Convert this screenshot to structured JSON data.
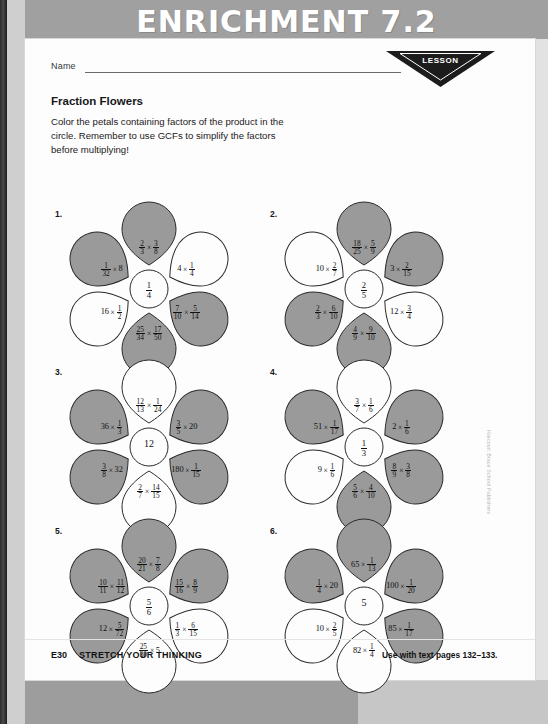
{
  "header": {
    "title": "ENRICHMENT 7.2"
  },
  "lesson_badge": {
    "word": "LESSON",
    "number": "7.2"
  },
  "name_field": {
    "label": "Name",
    "value": ""
  },
  "worksheet": {
    "title": "Fraction Flowers",
    "instruction_lines": [
      "Color the petals containing factors of the product in the",
      "circle. Remember to use GCFs to simplify the factors",
      "before multiplying!"
    ]
  },
  "colors": {
    "header_band": "#a0a0a0",
    "petal_shaded": "#9a9a9a",
    "petal_white": "#fdfdfd",
    "petal_outline": "#2a2a2a",
    "page": "#fdfdfd",
    "scan_background": "#8f8f8f"
  },
  "flowers": [
    {
      "number": "1.",
      "center": {
        "whole": "",
        "num": "1",
        "den": "4"
      },
      "petals": [
        {
          "position": "top",
          "shaded": true,
          "left": {
            "num": "2",
            "den": "3"
          },
          "right": {
            "num": "3",
            "den": "8"
          }
        },
        {
          "position": "upper-right",
          "shaded": false,
          "left": {
            "whole": "4"
          },
          "right": {
            "num": "1",
            "den": "4"
          }
        },
        {
          "position": "lower-right",
          "shaded": true,
          "left": {
            "num": "7",
            "den": "10"
          },
          "right": {
            "num": "5",
            "den": "14"
          }
        },
        {
          "position": "bottom",
          "shaded": true,
          "left": {
            "num": "25",
            "den": "34"
          },
          "right": {
            "num": "17",
            "den": "50"
          }
        },
        {
          "position": "lower-left",
          "shaded": false,
          "left": {
            "whole": "16"
          },
          "right": {
            "num": "1",
            "den": "2"
          }
        },
        {
          "position": "upper-left",
          "shaded": true,
          "left": {
            "num": "1",
            "den": "32"
          },
          "right": {
            "whole": "8"
          }
        }
      ]
    },
    {
      "number": "2.",
      "center": {
        "whole": "",
        "num": "2",
        "den": "5"
      },
      "petals": [
        {
          "position": "top",
          "shaded": true,
          "left": {
            "num": "18",
            "den": "25"
          },
          "right": {
            "num": "5",
            "den": "9"
          }
        },
        {
          "position": "upper-right",
          "shaded": true,
          "left": {
            "whole": "3"
          },
          "right": {
            "num": "2",
            "den": "15"
          }
        },
        {
          "position": "lower-right",
          "shaded": false,
          "left": {
            "whole": "12"
          },
          "right": {
            "num": "3",
            "den": "4"
          }
        },
        {
          "position": "bottom",
          "shaded": true,
          "left": {
            "num": "4",
            "den": "9"
          },
          "right": {
            "num": "9",
            "den": "10"
          }
        },
        {
          "position": "lower-left",
          "shaded": true,
          "left": {
            "num": "2",
            "den": "3"
          },
          "right": {
            "num": "6",
            "den": "10"
          }
        },
        {
          "position": "upper-left",
          "shaded": false,
          "left": {
            "whole": "10"
          },
          "right": {
            "num": "2",
            "den": "7"
          }
        }
      ]
    },
    {
      "number": "3.",
      "center": {
        "whole": "12",
        "num": "",
        "den": ""
      },
      "petals": [
        {
          "position": "top",
          "shaded": false,
          "left": {
            "num": "12",
            "den": "13"
          },
          "right": {
            "num": "1",
            "den": "24"
          }
        },
        {
          "position": "upper-right",
          "shaded": true,
          "left": {
            "num": "3",
            "den": "5"
          },
          "right": {
            "whole": "20"
          }
        },
        {
          "position": "lower-right",
          "shaded": true,
          "left": {
            "whole": "180"
          },
          "right": {
            "num": "1",
            "den": "15"
          }
        },
        {
          "position": "bottom",
          "shaded": false,
          "left": {
            "num": "2",
            "den": "7"
          },
          "right": {
            "num": "14",
            "den": "15"
          }
        },
        {
          "position": "lower-left",
          "shaded": true,
          "left": {
            "num": "3",
            "den": "8"
          },
          "right": {
            "whole": "32"
          }
        },
        {
          "position": "upper-left",
          "shaded": true,
          "left": {
            "whole": "36"
          },
          "right": {
            "num": "1",
            "den": "3"
          }
        }
      ]
    },
    {
      "number": "4.",
      "center": {
        "whole": "",
        "num": "1",
        "den": "3"
      },
      "petals": [
        {
          "position": "top",
          "shaded": false,
          "left": {
            "num": "3",
            "den": "7"
          },
          "right": {
            "num": "1",
            "den": "6"
          }
        },
        {
          "position": "upper-right",
          "shaded": true,
          "left": {
            "whole": "2"
          },
          "right": {
            "num": "1",
            "den": "6"
          }
        },
        {
          "position": "lower-right",
          "shaded": true,
          "left": {
            "num": "8",
            "den": "9"
          },
          "right": {
            "num": "3",
            "den": "8"
          }
        },
        {
          "position": "bottom",
          "shaded": true,
          "left": {
            "num": "5",
            "den": "6"
          },
          "right": {
            "num": "4",
            "den": "10"
          }
        },
        {
          "position": "lower-left",
          "shaded": false,
          "left": {
            "whole": "9"
          },
          "right": {
            "num": "1",
            "den": "6"
          }
        },
        {
          "position": "upper-left",
          "shaded": true,
          "left": {
            "whole": "51"
          },
          "right": {
            "num": "1",
            "den": "17"
          }
        }
      ]
    },
    {
      "number": "5.",
      "center": {
        "whole": "",
        "num": "5",
        "den": "6"
      },
      "petals": [
        {
          "position": "top",
          "shaded": true,
          "left": {
            "num": "20",
            "den": "21"
          },
          "right": {
            "num": "7",
            "den": "8"
          }
        },
        {
          "position": "upper-right",
          "shaded": true,
          "left": {
            "num": "15",
            "den": "16"
          },
          "right": {
            "num": "8",
            "den": "9"
          }
        },
        {
          "position": "lower-right",
          "shaded": false,
          "left": {
            "num": "1",
            "den": "3"
          },
          "right": {
            "num": "6",
            "den": "15"
          }
        },
        {
          "position": "bottom",
          "shaded": false,
          "left": {
            "num": "25",
            "den": "30"
          },
          "right": {
            "whole": "5"
          }
        },
        {
          "position": "lower-left",
          "shaded": true,
          "left": {
            "whole": "12"
          },
          "right": {
            "num": "5",
            "den": "72"
          }
        },
        {
          "position": "upper-left",
          "shaded": true,
          "left": {
            "num": "10",
            "den": "11"
          },
          "right": {
            "num": "11",
            "den": "12"
          }
        }
      ]
    },
    {
      "number": "6.",
      "center": {
        "whole": "5",
        "num": "",
        "den": ""
      },
      "petals": [
        {
          "position": "top",
          "shaded": true,
          "left": {
            "whole": "65"
          },
          "right": {
            "num": "1",
            "den": "13"
          }
        },
        {
          "position": "upper-right",
          "shaded": true,
          "left": {
            "whole": "100"
          },
          "right": {
            "num": "1",
            "den": "20"
          }
        },
        {
          "position": "lower-right",
          "shaded": true,
          "left": {
            "whole": "85"
          },
          "right": {
            "num": "1",
            "den": "17"
          }
        },
        {
          "position": "bottom",
          "shaded": false,
          "left": {
            "whole": "82"
          },
          "right": {
            "num": "1",
            "den": "4"
          }
        },
        {
          "position": "lower-left",
          "shaded": false,
          "left": {
            "whole": "10"
          },
          "right": {
            "num": "2",
            "den": "5"
          }
        },
        {
          "position": "upper-left",
          "shaded": true,
          "left": {
            "num": "1",
            "den": "4"
          },
          "right": {
            "whole": "20"
          }
        }
      ]
    }
  ],
  "footer": {
    "code": "E30",
    "label": "STRETCH YOUR THINKING",
    "reference": "Use with text pages 132–133."
  },
  "side_credit": "Harcourt Brace School Publishers"
}
